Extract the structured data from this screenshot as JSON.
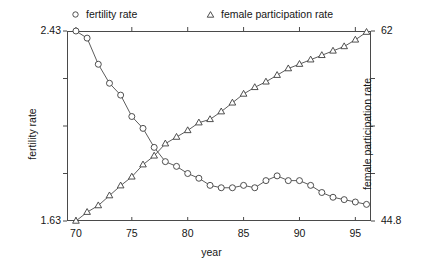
{
  "chart_data": {
    "type": "line",
    "title": "",
    "xlabel": "year",
    "ylabel": "fertility rate",
    "y2label": "female participation rate",
    "grid": false,
    "legend_position": "top",
    "xlim": [
      69.2,
      96.4
    ],
    "xticks": [
      70,
      75,
      80,
      85,
      90,
      95
    ],
    "xticklabels": [
      "70",
      "75",
      "80",
      "85",
      "90",
      "95"
    ],
    "ylim": [
      1.63,
      2.43
    ],
    "yticks": [
      1.63,
      2.43
    ],
    "yticklabels": [
      "1.63",
      "2.43"
    ],
    "y2lim": [
      44.8,
      62
    ],
    "y2ticks": [
      44.8,
      62
    ],
    "y2ticklabels": [
      "44.8",
      "62"
    ],
    "x": [
      70,
      71,
      72,
      73,
      74,
      75,
      76,
      77,
      78,
      79,
      80,
      81,
      82,
      83,
      84,
      85,
      86,
      87,
      88,
      89,
      90,
      91,
      92,
      93,
      94,
      95,
      96
    ],
    "series": [
      {
        "name": "fertility rate",
        "axis": "left",
        "marker": "circle",
        "values": [
          2.43,
          2.4,
          2.29,
          2.21,
          2.16,
          2.07,
          2.02,
          1.94,
          1.88,
          1.86,
          1.83,
          1.81,
          1.78,
          1.77,
          1.77,
          1.78,
          1.77,
          1.8,
          1.82,
          1.8,
          1.8,
          1.78,
          1.75,
          1.73,
          1.72,
          1.71,
          1.7
        ]
      },
      {
        "name": "female participation rate",
        "axis": "right",
        "marker": "triangle",
        "values": [
          44.8,
          45.6,
          46.2,
          47.1,
          48.0,
          48.8,
          49.9,
          50.7,
          51.8,
          52.4,
          53.0,
          53.7,
          54.0,
          54.7,
          55.5,
          56.3,
          56.9,
          57.4,
          58.0,
          58.6,
          59.0,
          59.4,
          59.8,
          60.2,
          60.6,
          61.2,
          61.9
        ]
      }
    ]
  },
  "legend": {
    "entries": [
      {
        "label": "fertility rate",
        "marker": "circle"
      },
      {
        "label": "female participation rate",
        "marker": "triangle"
      }
    ]
  },
  "colors": {
    "line": "#4a4a4a",
    "marker_stroke": "#3c3c3c",
    "marker_fill": "#ffffff",
    "axis": "#4a4a4a",
    "text": "#161616",
    "background": "#ffffff"
  }
}
